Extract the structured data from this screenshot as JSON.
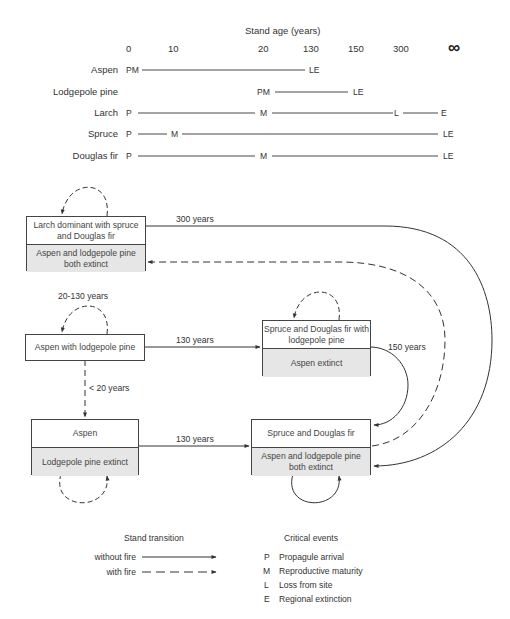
{
  "timeline": {
    "title": "Stand age (years)",
    "ticks": [
      "0",
      "10",
      "20",
      "130",
      "150",
      "300",
      "∞"
    ],
    "species": [
      {
        "name": "Aspen",
        "events": [
          {
            "label": "PM",
            "at": "0"
          },
          {
            "label": "LE",
            "at": "130"
          }
        ]
      },
      {
        "name": "Lodgepole pine",
        "events": [
          {
            "label": "PM",
            "at": "20"
          },
          {
            "label": "LE",
            "at": "150"
          }
        ]
      },
      {
        "name": "Larch",
        "events": [
          {
            "label": "P",
            "at": "0"
          },
          {
            "label": "M",
            "at": "20"
          },
          {
            "label": "L",
            "at": "300"
          },
          {
            "label": "E",
            "at": "∞"
          }
        ]
      },
      {
        "name": "Spruce",
        "events": [
          {
            "label": "P",
            "at": "0"
          },
          {
            "label": "M",
            "at": "10"
          },
          {
            "label": "LE",
            "at": "∞"
          }
        ]
      },
      {
        "name": "Douglas fir",
        "events": [
          {
            "label": "P",
            "at": "0"
          },
          {
            "label": "M",
            "at": "20"
          },
          {
            "label": "LE",
            "at": "∞"
          }
        ]
      }
    ]
  },
  "states": {
    "larch": {
      "top": "Larch dominant with spruce and Douglas fir",
      "bottom": "Aspen and lodgepole pine both extinct"
    },
    "aspen_lodgepole": {
      "top": "Aspen with lodgepole pine"
    },
    "spruce_df_lodgepole": {
      "top": "Spruce and Douglas fir with lodgepole pine",
      "bottom": "Aspen extinct"
    },
    "aspen": {
      "top": "Aspen",
      "bottom": "Lodgepole pine extinct"
    },
    "spruce_df": {
      "top": "Spruce and Douglas fir",
      "bottom": "Aspen and lodgepole pine both extinct"
    }
  },
  "transitions": {
    "t300": "300 years",
    "t20_130": "20-130 years",
    "t130_a": "130 years",
    "t150": "150 years",
    "t_lt20": "< 20 years",
    "t130_b": "130 years"
  },
  "legend": {
    "transition_title": "Stand transition",
    "without_fire": "without fire",
    "with_fire": "with fire",
    "events_title": "Critical events",
    "events": [
      {
        "code": "P",
        "label": "Propagule arrival"
      },
      {
        "code": "M",
        "label": "Reproductive maturity"
      },
      {
        "code": "L",
        "label": "Loss from site"
      },
      {
        "code": "E",
        "label": "Regional extinction"
      }
    ]
  },
  "colors": {
    "line": "#333333",
    "box_shade": "#e6e6e6"
  }
}
